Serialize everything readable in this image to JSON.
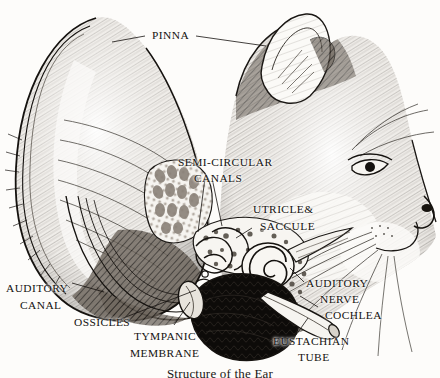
{
  "figure": {
    "caption": "Structure of the Ear",
    "style": "pen-and-ink engraving",
    "background_color": "#fdfcfa",
    "ink_color": "#141210"
  },
  "labels": [
    {
      "id": "pinna",
      "text": "PINNA",
      "lines": [
        "PINNA"
      ]
    },
    {
      "id": "semicircular",
      "text": "SEMI-CIRCULAR CANALS",
      "lines": [
        "SEMI-CIRCULAR",
        "CANALS"
      ]
    },
    {
      "id": "utricle-saccule",
      "text": "UTRICLE& SACCULE",
      "lines": [
        "UTRICLE&",
        "SACCULE"
      ]
    },
    {
      "id": "auditory-canal",
      "text": "AUDITORY CANAL",
      "lines": [
        "AUDITORY",
        "CANAL"
      ]
    },
    {
      "id": "ossicles",
      "text": "OSSICLES",
      "lines": [
        "OSSICLES"
      ]
    },
    {
      "id": "tympanic-membrane",
      "text": "TYMPANIC MEMBRANE",
      "lines": [
        "TYMPANIC",
        "MEMBRANE"
      ]
    },
    {
      "id": "auditory-nerve",
      "text": "AUDITORY NERVE",
      "lines": [
        "AUDITORY",
        "NERVE"
      ]
    },
    {
      "id": "cochlea",
      "text": "COCHLEA",
      "lines": [
        "COCHLEA"
      ]
    },
    {
      "id": "eustachian-tube",
      "text": "EUSTACHIAN TUBE",
      "lines": [
        "EUSTACHIAN",
        "TUBE"
      ]
    }
  ],
  "label_text": {
    "pinna": "PINNA",
    "semicircular_1": "SEMI-CIRCULAR",
    "semicircular_2": "CANALS",
    "utricle": "UTRICLE&",
    "saccule": "SACCULE",
    "auditory_canal_1": "AUDITORY",
    "auditory_canal_2": "CANAL",
    "ossicles": "OSSICLES",
    "tympanic_1": "TYMPANIC",
    "tympanic_2": "MEMBRANE",
    "auditory_nerve_1": "AUDITORY",
    "auditory_nerve_2": "NERVE",
    "cochlea": "COCHLEA",
    "eustachian_1": "EUSTACHIAN",
    "eustachian_2": "TUBE"
  }
}
